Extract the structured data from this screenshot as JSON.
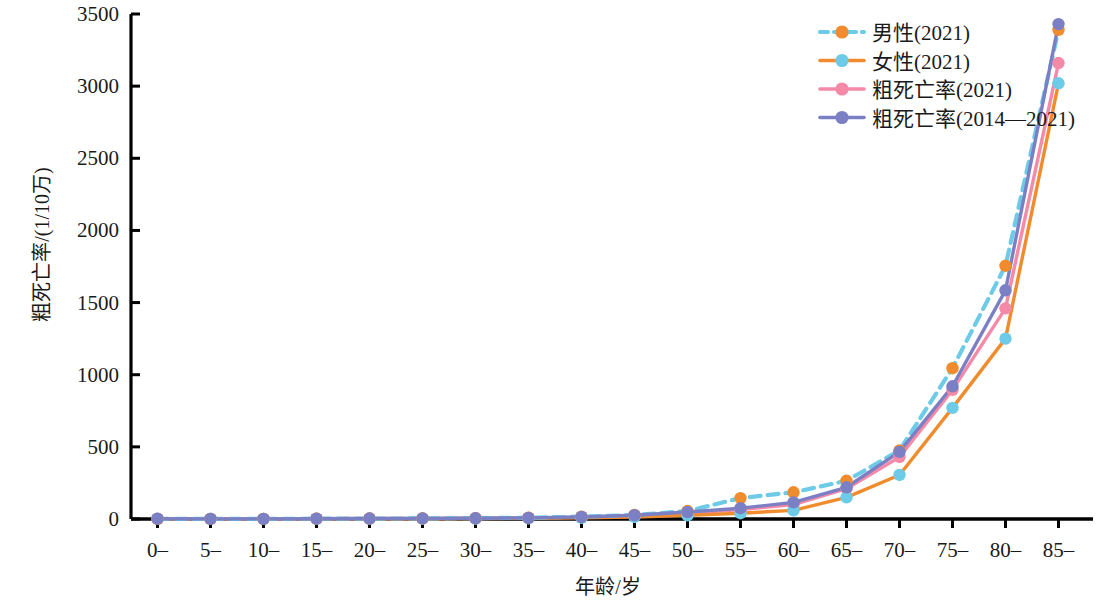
{
  "chart_data": {
    "type": "line",
    "title": "",
    "xlabel": "年龄/岁",
    "ylabel": "粗死亡率/(1/10万)",
    "categories": [
      "0–",
      "5–",
      "10–",
      "15–",
      "20–",
      "25–",
      "30–",
      "35–",
      "40–",
      "45–",
      "50–",
      "55–",
      "60–",
      "65–",
      "70–",
      "75–",
      "80–",
      "85–"
    ],
    "ylim": [
      0,
      3500
    ],
    "yticks": [
      0,
      500,
      1000,
      1500,
      2000,
      2500,
      3000,
      3500
    ],
    "ytick_labels": [
      "0",
      "500",
      "1000",
      "1500",
      "2000",
      "2500",
      "3000",
      "3500"
    ],
    "grid": false,
    "legend_position": "top-right",
    "series": [
      {
        "name": "男性(2021)",
        "color": "#f08c2e",
        "line_color": "#6ecbe8",
        "line_style": "dashed",
        "marker": "circle",
        "values": [
          1,
          1,
          1,
          2,
          3,
          4,
          6,
          9,
          16,
          28,
          55,
          145,
          185,
          265,
          475,
          1045,
          1755,
          3390
        ]
      },
      {
        "name": "女性(2021)",
        "color": "#6ecbe8",
        "line_color": "#f08c2e",
        "line_style": "solid",
        "marker": "circle",
        "values": [
          1,
          1,
          1,
          1,
          2,
          2,
          3,
          5,
          8,
          14,
          25,
          40,
          60,
          150,
          305,
          770,
          1250,
          3020
        ]
      },
      {
        "name": "粗死亡率(2021)",
        "color": "#f589a8",
        "line_color": "#f589a8",
        "line_style": "solid",
        "marker": "circle",
        "values": [
          1,
          1,
          1,
          2,
          3,
          3,
          5,
          7,
          12,
          21,
          40,
          65,
          100,
          210,
          430,
          895,
          1460,
          3160
        ]
      },
      {
        "name": "粗死亡率(2014—2021)",
        "color": "#7b7fc4",
        "line_color": "#7b7fc4",
        "line_style": "solid",
        "marker": "circle",
        "values": [
          2,
          1,
          1,
          2,
          3,
          4,
          5,
          8,
          14,
          26,
          48,
          75,
          115,
          220,
          465,
          920,
          1585,
          3430
        ]
      }
    ]
  },
  "axis": {
    "y_axis_label": "粗死亡率/(1/10万)",
    "x_axis_label": "年龄/岁"
  },
  "legend": {
    "items": [
      {
        "label": "男性(2021)"
      },
      {
        "label": "女性(2021)"
      },
      {
        "label": "粗死亡率(2021)"
      },
      {
        "label": "粗死亡率(2014—2021)"
      }
    ]
  }
}
